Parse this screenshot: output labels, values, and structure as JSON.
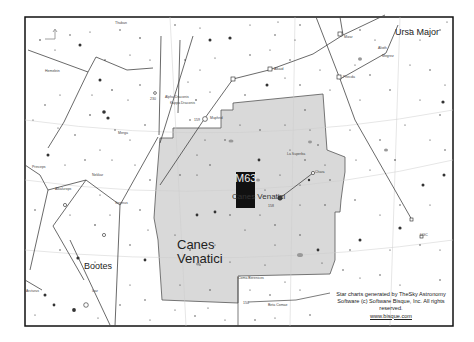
{
  "map": {
    "title_object": "M63",
    "highlighted_constellation": "Canes Venatici",
    "constellation_labels": {
      "canes_venatici_line1": "Canes",
      "canes_venatici_line2": "Venatici",
      "canes_venatici_inline": "Canes Venatici",
      "ursa_major": "Ursa Major",
      "bootes": "Bootes",
      "coma_berenices": "Coma Berenices"
    },
    "star_labels": {
      "alkaid": "Alkaid",
      "mizar": "Mizar",
      "alioth": "Alioth",
      "megrez": "Megrez",
      "phecda": "Phecda",
      "cor_caroli": "Cor Caroli",
      "chara": "Chara",
      "la_superba": "La Superba",
      "nekkar": "Nekkar",
      "arcturus": "Arcturus",
      "muphrid": "Muphrid",
      "seginus": "Seginus",
      "merga": "Merga",
      "hemelein": "Hemelein",
      "alkalurops": "Alkalurops",
      "izar": "Izar",
      "princeps": "Princeps",
      "thuban": "Thuban",
      "edasich": "Edasich",
      "alpha_draconis": "Alpha Draconis",
      "kappa_draconis": "Kappa Draconis",
      "14_bootis": "14 Boo",
      "diadem": "Diadem",
      "beta_comae": "Beta Comae"
    },
    "markers": {
      "ugc": "UGC",
      "num_150": "150",
      "num_158": "158",
      "num_159": "159",
      "num_230": "230"
    }
  },
  "credit": {
    "line1": "Star charts generated by TheSky Astronomy",
    "line2": "Software (c) Software Bisque, Inc. All rights",
    "line3": "reserved.",
    "link": "www.bisque.com"
  },
  "colors": {
    "background": "#ffffff",
    "highlight_fill": "#d9d9d9",
    "border": "#111111",
    "lines": "#333333"
  }
}
